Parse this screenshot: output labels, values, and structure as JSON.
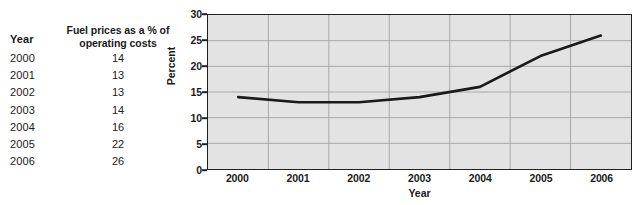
{
  "table": {
    "header_year": "Year",
    "header_metric_line1": "Fuel prices as a % of",
    "header_metric_line2": "operating costs",
    "rows": [
      {
        "year": "2000",
        "value": "14"
      },
      {
        "year": "2001",
        "value": "13"
      },
      {
        "year": "2002",
        "value": "13"
      },
      {
        "year": "2003",
        "value": "14"
      },
      {
        "year": "2004",
        "value": "16"
      },
      {
        "year": "2005",
        "value": "22"
      },
      {
        "year": "2006",
        "value": "26"
      }
    ]
  },
  "chart_data": {
    "type": "line",
    "title": "",
    "xlabel": "Year",
    "ylabel": "Percent",
    "categories": [
      "2000",
      "2001",
      "2002",
      "2003",
      "2004",
      "2005",
      "2006"
    ],
    "values": [
      14,
      13,
      13,
      14,
      16,
      22,
      26
    ],
    "series": [
      {
        "name": "Fuel prices as a % of operating costs",
        "values": [
          14,
          13,
          13,
          14,
          16,
          22,
          26
        ]
      }
    ],
    "ylim": [
      0,
      30
    ],
    "y_ticks": [
      0,
      5,
      10,
      15,
      20,
      25,
      30
    ],
    "x_ticks": [
      "2000",
      "2001",
      "2002",
      "2003",
      "2004",
      "2005",
      "2006"
    ],
    "grid": true,
    "legend": "none",
    "plot_background": "#e3e3e3",
    "line_color": "#1a1a1a",
    "gridline_color": "#a8a8a8",
    "axis_color": "#202020"
  }
}
